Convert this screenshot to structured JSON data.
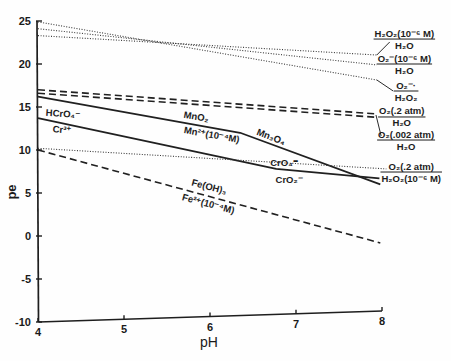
{
  "figure": {
    "xlabel": "pH",
    "ylabel": "pe"
  },
  "chart_data": {
    "type": "line",
    "title": "",
    "xlabel": "pH",
    "ylabel": "pe",
    "xlim": [
      4,
      8
    ],
    "ylim": [
      -10,
      25
    ],
    "xticks": [
      4,
      5,
      6,
      7,
      8
    ],
    "yticks": [
      -10,
      -5,
      0,
      5,
      10,
      15,
      20,
      25
    ],
    "grid": false,
    "legend": "none (inline boundary labels)",
    "series": [
      {
        "name": "H2O2(10^-6 M) / H2O",
        "style": "dotted",
        "points": [
          [
            4,
            23.3
          ],
          [
            7.94,
            21.05
          ]
        ]
      },
      {
        "name": "O2-(10^-6 M) / H2O",
        "style": "dotted",
        "points": [
          [
            4,
            24.1
          ],
          [
            7.94,
            19.9
          ]
        ]
      },
      {
        "name": "O2- / H2O2",
        "style": "dotted",
        "points": [
          [
            4,
            24.9
          ],
          [
            7.94,
            18.14
          ]
        ]
      },
      {
        "name": "O2(.2 atm) / H2O",
        "style": "dashed",
        "points": [
          [
            4,
            17.0
          ],
          [
            7.94,
            14.2
          ]
        ]
      },
      {
        "name": "O2(.002 atm) / H2O",
        "style": "dashed",
        "points": [
          [
            4,
            16.6
          ],
          [
            7.94,
            13.8
          ]
        ]
      },
      {
        "name": "MnO2 / Mn2+(10^-4 M), then Mn3O4",
        "style": "solid",
        "points": [
          [
            4,
            16.2
          ],
          [
            6.35,
            12.0
          ],
          [
            7.98,
            6.0
          ]
        ]
      },
      {
        "name": "HCrO4- / Cr3+, then CrO4= / CrO2-",
        "style": "solid",
        "points": [
          [
            4,
            13.7
          ],
          [
            6.77,
            7.8
          ],
          [
            7.97,
            6.7
          ]
        ]
      },
      {
        "name": "O2(.2 atm) / H2O2(10^-6 M)",
        "style": "dotted",
        "points": [
          [
            4,
            10.2
          ],
          [
            8.05,
            7.8
          ]
        ]
      },
      {
        "name": "Fe(OH)3 / Fe2+(10^-4 M)",
        "style": "dashed",
        "points": [
          [
            4,
            10.0
          ],
          [
            7.98,
            -0.8
          ]
        ]
      }
    ],
    "leaders": [
      [
        [
          7.94,
          21.05
        ],
        [
          8.09,
          22.56
        ]
      ],
      [
        [
          7.94,
          18.14
        ],
        [
          8.13,
          16.86
        ]
      ],
      [
        [
          7.93,
          14.07
        ],
        [
          7.99,
          11.63
        ]
      ]
    ],
    "fraction_labels": [
      {
        "num": "H₂O₂(10⁻⁶ M)",
        "den": "H₂O",
        "ph": 8.26,
        "pe": 22.9
      },
      {
        "num": "O₂⁻(10⁻⁶ M)",
        "den": "H₂O",
        "ph": 8.26,
        "pe": 20.0
      },
      {
        "num": "O₂⁻·",
        "den": "H₂O₂",
        "ph": 8.28,
        "pe": 16.86
      },
      {
        "num": "O₂(.2 atm)",
        "den": "H₂O",
        "ph": 8.23,
        "pe": 13.84
      },
      {
        "num": "O₂(.002 atm)",
        "den": "H₂O",
        "ph": 8.28,
        "pe": 11.16
      },
      {
        "num": "O₂(.2 atm)",
        "den": "H₂O₂(10⁻⁶ M)",
        "ph": 8.34,
        "pe": 7.44
      }
    ],
    "annotations": [
      {
        "text": "HCrO₄⁻",
        "ph": 4.29,
        "pe": 14.19,
        "rotate": 4
      },
      {
        "text": "Cr³⁺",
        "ph": 4.28,
        "pe": 12.33,
        "rotate": 4
      },
      {
        "text": "MnO₂",
        "ph": 5.84,
        "pe": 13.84,
        "rotate": 10
      },
      {
        "text": "Mn²⁺(10⁻⁴M)",
        "ph": 6.02,
        "pe": 11.74,
        "rotate": 10
      },
      {
        "text": "Mn₃O₄",
        "ph": 6.71,
        "pe": 11.51,
        "rotate": 21
      },
      {
        "text": "CrO₄⁼",
        "ph": 6.86,
        "pe": 8.49,
        "rotate": 0
      },
      {
        "text": "CrO₂⁻",
        "ph": 6.92,
        "pe": 6.51,
        "rotate": 0
      },
      {
        "text": "Fe(OH)₃",
        "ph": 5.99,
        "pe": 5.7,
        "rotate": 15
      },
      {
        "text": "Fe²⁺(10⁻⁴M)",
        "ph": 5.98,
        "pe": 3.72,
        "rotate": 15
      }
    ]
  }
}
